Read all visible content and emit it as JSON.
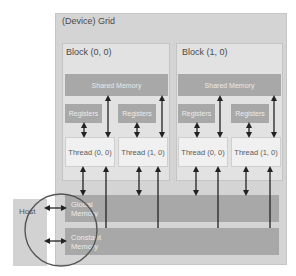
{
  "diagram": {
    "grid": {
      "label": "(Device) Grid"
    },
    "blocks": [
      {
        "label": "Block (0, 0)",
        "shared_memory": "Shared Memory",
        "registers": [
          "Registers",
          "Registers"
        ],
        "threads": [
          "Thread (0, 0)",
          "Thread (1, 0)"
        ]
      },
      {
        "label": "Block (1, 0)",
        "shared_memory": "Shared Memory",
        "registers": [
          "Registers",
          "Registers"
        ],
        "threads": [
          "Thread (0, 0)",
          "Thread (1, 0)"
        ]
      }
    ],
    "global_memory": {
      "line1": "Global",
      "line2": "Memory"
    },
    "constant_memory": {
      "line1": "Constant",
      "line2": "Memory"
    },
    "host": {
      "label": "Host"
    },
    "colors": {
      "grid_bg": "#d4d4d4",
      "block_bg": "#e2e2e2",
      "memory_bg": "#a8a8a8",
      "thread_bg": "#f0f0f0",
      "arrow": "#222222",
      "circle": "#555555"
    }
  }
}
